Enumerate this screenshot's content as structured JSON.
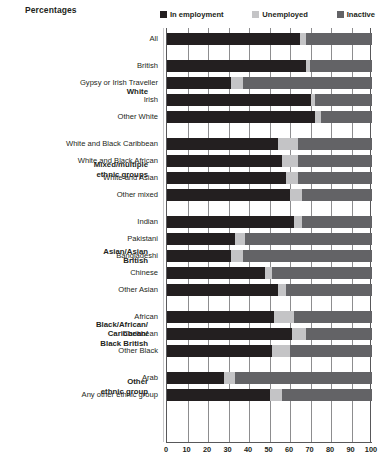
{
  "header": {
    "title": "Percentages"
  },
  "legend": {
    "position": "top-right",
    "items": [
      {
        "label": "In employment",
        "color": "#231f20",
        "icon": "square-swatch-icon"
      },
      {
        "label": "Unemployed",
        "color": "#c4c4c6",
        "icon": "square-swatch-icon"
      },
      {
        "label": "Inactive",
        "color": "#636366",
        "icon": "square-swatch-icon"
      }
    ]
  },
  "axis": {
    "ticks": [
      "0",
      "10",
      "20",
      "30",
      "40",
      "50",
      "60",
      "70",
      "80",
      "90",
      "100"
    ],
    "min": 0,
    "max": 100
  },
  "groups": [
    {
      "label": "",
      "rows": [
        0
      ]
    },
    {
      "label": "White",
      "rows": [
        1,
        2,
        3,
        4
      ]
    },
    {
      "label": "Mixed/multiple\nethnic groups",
      "rows": [
        5,
        6,
        7,
        8
      ]
    },
    {
      "label": "Asian/Asian\nBritish",
      "rows": [
        9,
        10,
        11,
        12,
        13
      ]
    },
    {
      "label": "Black/African/\nCaribbean/\nBlack British",
      "rows": [
        14,
        15,
        16
      ]
    },
    {
      "label": "Other\nethnic group",
      "rows": [
        17,
        18
      ]
    }
  ],
  "chart_data": {
    "type": "bar",
    "orientation": "horizontal",
    "stacked": true,
    "title": "Percentages",
    "xlabel": "",
    "ylabel": "",
    "xlim": [
      0,
      100
    ],
    "grid": true,
    "legend_position": "top-right",
    "categories": [
      "All",
      "British",
      "Gypsy or Irish Traveller",
      "Irish",
      "Other White",
      "White and Black Caribbean",
      "White and Black African",
      "White and Asian",
      "Other mixed",
      "Indian",
      "Pakistani",
      "Bangladeshi",
      "Chinese",
      "Other Asian",
      "African",
      "Caribbean",
      "Other Black",
      "Arab",
      "Any other ethnic group"
    ],
    "series": [
      {
        "name": "In employment",
        "color": "#231f20",
        "values": [
          65,
          68,
          31,
          70,
          72,
          54,
          56,
          58,
          60,
          62,
          33,
          31,
          48,
          54,
          52,
          61,
          51,
          28,
          50
        ]
      },
      {
        "name": "Unemployed",
        "color": "#c4c4c6",
        "values": [
          3,
          2,
          6,
          2,
          3,
          10,
          8,
          6,
          6,
          4,
          5,
          6,
          3,
          4,
          10,
          7,
          9,
          5,
          6
        ]
      },
      {
        "name": "Inactive",
        "color": "#636366",
        "values": [
          32,
          30,
          63,
          28,
          25,
          36,
          36,
          36,
          34,
          34,
          62,
          63,
          49,
          42,
          38,
          32,
          40,
          67,
          44
        ]
      }
    ]
  }
}
